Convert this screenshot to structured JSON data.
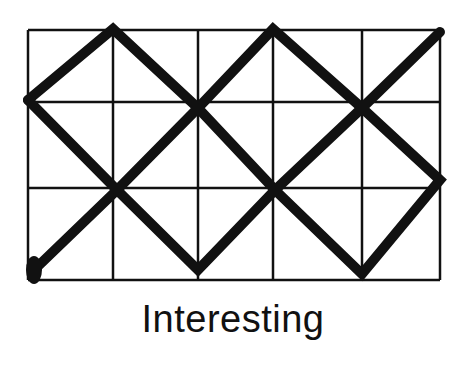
{
  "caption": "Interesting",
  "colors": {
    "ink": "#111111",
    "background": "#ffffff"
  },
  "grid": {
    "columns": 5,
    "rows": 3,
    "x_lines": [
      28,
      113,
      198,
      273,
      362,
      440
    ],
    "y_lines": [
      30,
      102,
      188,
      280
    ]
  },
  "path": {
    "start_marker": {
      "x": 34,
      "y": 270
    },
    "segments": [
      [
        [
          28,
          100
        ],
        [
          113,
          29
        ],
        [
          198,
          108
        ],
        [
          275,
          190
        ],
        [
          362,
          274
        ],
        [
          440,
          180
        ],
        [
          362,
          108
        ],
        [
          273,
          29
        ],
        [
          198,
          108
        ],
        [
          117,
          190
        ],
        [
          34,
          270
        ]
      ],
      [
        [
          28,
          100
        ],
        [
          117,
          190
        ],
        [
          198,
          270
        ],
        [
          275,
          190
        ],
        [
          362,
          108
        ],
        [
          440,
          32
        ]
      ]
    ]
  }
}
